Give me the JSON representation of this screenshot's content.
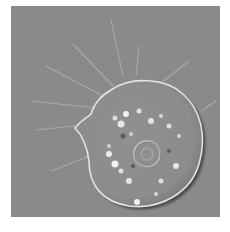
{
  "image": {
    "description": "DIC microscopy image of a rounded amoeboid cell with radiating filopodia",
    "colors": {
      "background": "#8a8a8a",
      "border": "#ffffff",
      "cell_highlight": "#e8e8e8",
      "cell_shadow": "#3c3c3c"
    }
  }
}
